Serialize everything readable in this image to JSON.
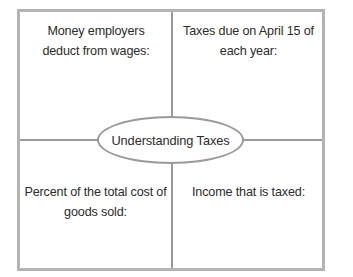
{
  "diagram": {
    "type": "four-quadrant-concept-map",
    "center": {
      "label": "Understanding Taxes",
      "shape": "ellipse"
    },
    "quadrants": [
      {
        "position": "top-left",
        "text": "Money employers deduct from wages:"
      },
      {
        "position": "top-right",
        "text": "Taxes due on April 15 of each year:"
      },
      {
        "position": "bottom-left",
        "text": "Percent of the total cost of goods sold:"
      },
      {
        "position": "bottom-right",
        "text": "Income that is taxed:"
      }
    ],
    "colors": {
      "outer_border": "#b3b3b3",
      "divider": "#9a9a9a",
      "ellipse_border": "#9a9a9a",
      "text": "#2b2b2b",
      "background": "#ffffff"
    }
  }
}
